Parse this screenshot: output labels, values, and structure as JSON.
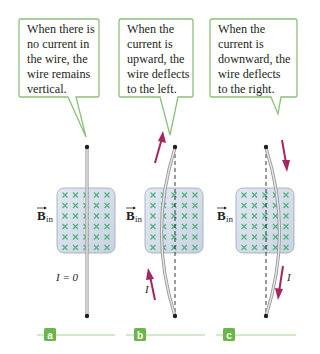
{
  "panels": [
    {
      "label": "a",
      "callout": [
        "When there is",
        "no current in",
        "the wire, the",
        "wire remains",
        "vertical."
      ],
      "current_label": "I = 0"
    },
    {
      "label": "b",
      "callout": [
        "When the",
        "current is",
        "upward, the",
        "wire deflects",
        "to the left."
      ],
      "current_label": "I"
    },
    {
      "label": "c",
      "callout": [
        "When the",
        "current is",
        "downward, the",
        "wire deflects",
        "to the right."
      ],
      "current_label": "I"
    }
  ],
  "field_label": {
    "symbol": "B",
    "subscript": "in"
  },
  "colors": {
    "callout_border": "#8cc07a",
    "label_box": "#6cb54a",
    "label_line": "#a9d48f",
    "field_box": "#d5dde8",
    "field_x": "#4fb07f",
    "arrow": "#a5265e",
    "wire": "#b8b8b8"
  }
}
